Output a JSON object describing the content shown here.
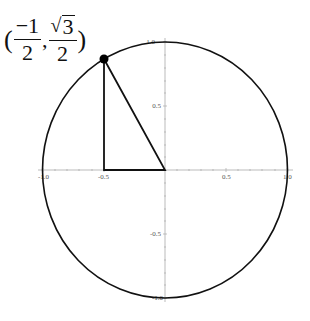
{
  "diagram": {
    "type": "unit-circle",
    "point_label": {
      "open_paren": "(",
      "x_numerator": "−1",
      "x_denominator": "2",
      "comma": ",",
      "y_radical_sign": "√",
      "y_radicand": "3",
      "y_denominator": "2",
      "close_paren": ")"
    },
    "point": {
      "x": -0.5,
      "y": 0.866
    },
    "triangle_vertices": [
      [
        0,
        0
      ],
      [
        -0.5,
        0
      ],
      [
        -0.5,
        0.866
      ]
    ],
    "axes": {
      "x_ticks": [
        "-1.0",
        "-0.5",
        "0.5",
        "1.0"
      ],
      "y_ticks": [
        "1.0",
        "0.5",
        "-0.5",
        "-1.0"
      ]
    },
    "colors": {
      "curve": "#111111",
      "axis": "#aaaaaa",
      "tick_label": "#555555",
      "point": "#000000"
    }
  }
}
